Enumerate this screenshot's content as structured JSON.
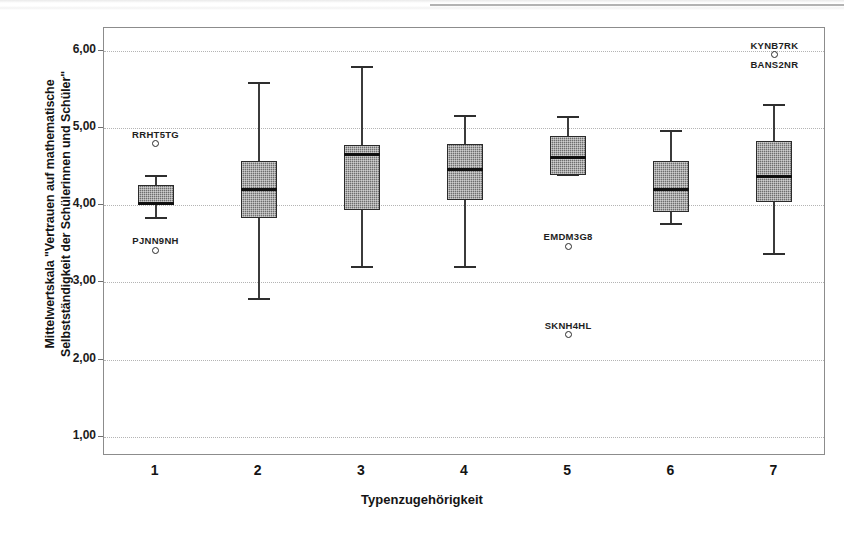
{
  "chart_data": {
    "type": "box",
    "title": "",
    "xlabel": "Typenzugehörigkeit",
    "ylabel": "Mittelwertskala \"Vertrauen auf mathematische\nSelbstständigkeit der Schülerinnen und Schüler\"",
    "ylim": [
      0.75,
      6.3
    ],
    "yticks": [
      "1,00",
      "2,00",
      "3,00",
      "4,00",
      "5,00",
      "6,00"
    ],
    "ytick_values": [
      1.0,
      2.0,
      3.0,
      4.0,
      5.0,
      6.0
    ],
    "xticks": [
      "1",
      "2",
      "3",
      "4",
      "5",
      "6",
      "7"
    ],
    "grid": "horizontal-dotted",
    "legend": "none",
    "boxes": [
      {
        "category": "1",
        "whisker_low": 3.83,
        "q1": 4.0,
        "median": 4.02,
        "q3": 4.27,
        "whisker_high": 4.38,
        "outliers": [
          {
            "value": 4.8,
            "label": "RRHT5TG",
            "label_position": "above"
          },
          {
            "value": 3.42,
            "label": "PJNN9NH",
            "label_position": "above"
          }
        ]
      },
      {
        "category": "2",
        "whisker_low": 2.79,
        "q1": 3.83,
        "median": 4.2,
        "q3": 4.58,
        "whisker_high": 5.59,
        "outliers": []
      },
      {
        "category": "3",
        "whisker_low": 3.2,
        "q1": 3.94,
        "median": 4.66,
        "q3": 4.78,
        "whisker_high": 5.8,
        "outliers": []
      },
      {
        "category": "4",
        "whisker_low": 3.2,
        "q1": 4.07,
        "median": 4.46,
        "q3": 4.79,
        "whisker_high": 5.16,
        "outliers": []
      },
      {
        "category": "5",
        "whisker_low": 4.4,
        "q1": 4.4,
        "median": 4.62,
        "q3": 4.9,
        "whisker_high": 5.15,
        "outliers": [
          {
            "value": 3.47,
            "label": "EMDM3G8",
            "label_position": "above"
          },
          {
            "value": 2.32,
            "label": "SKNH4HL",
            "label_position": "above"
          }
        ]
      },
      {
        "category": "6",
        "whisker_low": 3.76,
        "q1": 3.91,
        "median": 4.2,
        "q3": 4.58,
        "whisker_high": 4.96,
        "outliers": []
      },
      {
        "category": "7",
        "whisker_low": 3.37,
        "q1": 4.05,
        "median": 4.38,
        "q3": 4.84,
        "whisker_high": 5.3,
        "outliers": [
          {
            "value": 5.95,
            "label": "KYNB7RK",
            "label_position": "above",
            "label2": "BANS2NR"
          }
        ]
      }
    ]
  },
  "axis": {
    "y_title_line1": "Mittelwertskala \"Vertrauen auf mathematische",
    "y_title_line2": "Selbstständigkeit der Schülerinnen und Schüler\"",
    "x_title": "Typenzugehörigkeit"
  },
  "colors": {
    "box_fill": "#6e6e6e",
    "box_edge": "#2b2b2b",
    "median": "#101010",
    "grid": "#b4b4b4",
    "frame": "#8c8c8c",
    "text": "#141414"
  }
}
